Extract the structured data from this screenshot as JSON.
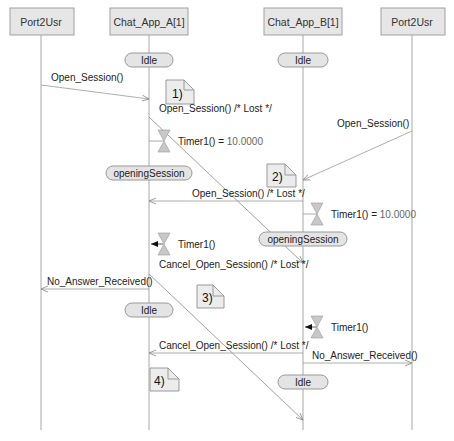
{
  "lifelines": [
    {
      "label": "Port2Usr",
      "x": 41
    },
    {
      "label": "Chat_App_A[1]",
      "x": 149
    },
    {
      "label": "Chat_App_B[1]",
      "x": 303
    },
    {
      "label": "Port2Usr",
      "x": 412
    }
  ],
  "states": {
    "idle_a_top": "Idle",
    "idle_b_top": "Idle",
    "opening_a": "openingSession",
    "opening_b": "openingSession",
    "idle_a_bottom": "Idle",
    "idle_b_bottom": "Idle"
  },
  "messages": {
    "m1": "Open_Session()",
    "m2": "Open_Session() /* Lost */",
    "m3": "Open_Session()",
    "m4": "Open_Session() /* Lost */",
    "m5": "Cancel_Open_Session() /* Lost */",
    "m6": "No_Answer_Received()",
    "m7": "Cancel_Open_Session() /* Lost */",
    "m8": "No_Answer_Received()"
  },
  "timers": {
    "t1_name": "Timer1() = ",
    "t1_value": "10.0000",
    "t2_name": "Timer1() = ",
    "t2_value": "10.0000",
    "t3_name": "Timer1()",
    "t4_name": "Timer1()"
  },
  "notes": {
    "n1": "1)",
    "n2": "2)",
    "n3": "3)",
    "n4": "4)"
  },
  "colors": {
    "box_fill": "#e6e6e6",
    "box_stroke": "#9a9a9a",
    "line": "#9a9a9a",
    "state_fill": "#e4e4e4",
    "note_fill": "#ececec",
    "timer_fill": "#c8c8c8"
  }
}
